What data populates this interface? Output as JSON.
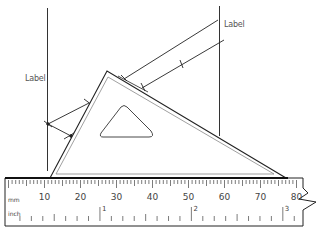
{
  "diagram": {
    "labels": {
      "left_label": "Label",
      "right_label": "Label"
    },
    "ruler": {
      "mm_unit": "mm",
      "inch_unit": "inch",
      "mm_numbers": [
        "10",
        "20",
        "30",
        "40",
        "50",
        "60",
        "70",
        "80"
      ],
      "inch_numbers": [
        "1",
        "2",
        "3"
      ]
    },
    "colors": {
      "line": "#222222",
      "inner_line": "#888888",
      "text": "#555555"
    }
  }
}
